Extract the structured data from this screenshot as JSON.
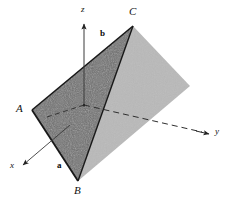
{
  "figure": {
    "background_color": "#ffffff",
    "width": 236,
    "height": 203
  },
  "colors": {
    "dark_face": "#6e6e6e",
    "light_face": "#b9b9b9",
    "edge": "#1a1a1a",
    "axis": "#333333",
    "label": "#111111",
    "noise": "#585858"
  },
  "vertices": {
    "A": {
      "label": "A",
      "x": 32,
      "y": 110,
      "label_x": 16,
      "label_y": 104
    },
    "B": {
      "label": "B",
      "x": 78,
      "y": 181,
      "label_x": 74,
      "label_y": 186
    },
    "C": {
      "label": "C",
      "x": 133,
      "y": 26,
      "label_x": 129,
      "label_y": 9
    },
    "O": {
      "label": "O",
      "x": 84,
      "y": 105
    },
    "D": {
      "label": "D",
      "x": 190,
      "y": 86
    }
  },
  "vectors": [
    {
      "name": "a",
      "label": "a",
      "label_x": 57,
      "label_y": 164
    },
    {
      "name": "b",
      "label": "b",
      "label_x": 100,
      "label_y": 32
    }
  ],
  "axes": [
    {
      "name": "z-axis",
      "label": "z",
      "label_x": 81,
      "label_y": 7,
      "from_x": 84,
      "from_y": 105,
      "to_x": 84,
      "to_y": 23,
      "dashed": false
    },
    {
      "name": "y-axis",
      "label": "y",
      "label_x": 215,
      "label_y": 129,
      "from_x": 84,
      "from_y": 105,
      "to_x": 211,
      "to_y": 134,
      "dashed": true
    },
    {
      "name": "x-axis",
      "label": "x",
      "label_x": 10,
      "label_y": 163,
      "from_x": 84,
      "from_y": 105,
      "to_x": 21,
      "to_y": 166,
      "dashed": false
    }
  ]
}
